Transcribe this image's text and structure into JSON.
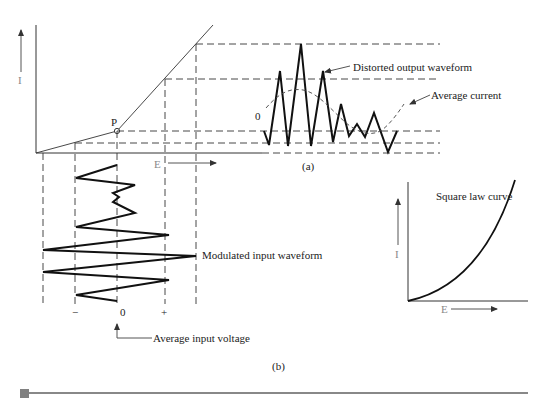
{
  "figure": {
    "panel_a": {
      "caption": "(a)",
      "y_axis_label": "I",
      "x_axis_label": "E",
      "operating_point_label": "P",
      "output_zero_label": "0",
      "output_waveform_label": "Distorted output waveform",
      "average_current_label": "Average current"
    },
    "panel_b": {
      "caption": "(b)",
      "input_waveform_label": "Modulated input waveform",
      "minus_label": "−",
      "zero_label": "0",
      "plus_label": "+",
      "average_input_label": "Average input voltage"
    },
    "square_law": {
      "title": "Square law curve",
      "y_axis_label": "I",
      "x_axis_label": "E"
    }
  },
  "colors": {
    "line": "#333333",
    "waveform": "#111111",
    "footer_bar": "#888888",
    "footer_square": "#808080"
  }
}
